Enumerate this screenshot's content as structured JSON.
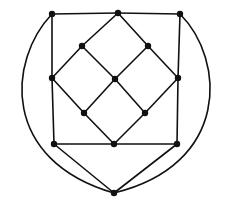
{
  "diagram": {
    "type": "planar-graph",
    "stroke_color": "#111111",
    "background": "#ffffff",
    "vertices": [
      {
        "id": "v1",
        "x": 52,
        "y": 14
      },
      {
        "id": "v2",
        "x": 118,
        "y": 13
      },
      {
        "id": "v3",
        "x": 180,
        "y": 14
      },
      {
        "id": "v4",
        "x": 82,
        "y": 46
      },
      {
        "id": "v5",
        "x": 148,
        "y": 46
      },
      {
        "id": "v6",
        "x": 52,
        "y": 78
      },
      {
        "id": "v7",
        "x": 115,
        "y": 79
      },
      {
        "id": "v8",
        "x": 178,
        "y": 78
      },
      {
        "id": "v9",
        "x": 84,
        "y": 113
      },
      {
        "id": "v10",
        "x": 145,
        "y": 113
      },
      {
        "id": "v11",
        "x": 54,
        "y": 144
      },
      {
        "id": "v12",
        "x": 114,
        "y": 144
      },
      {
        "id": "v13",
        "x": 177,
        "y": 144
      },
      {
        "id": "v14",
        "x": 114,
        "y": 193
      }
    ],
    "edges": [
      [
        "v1",
        "v2"
      ],
      [
        "v2",
        "v3"
      ],
      [
        "v1",
        "v6"
      ],
      [
        "v6",
        "v11"
      ],
      [
        "v3",
        "v8"
      ],
      [
        "v8",
        "v13"
      ],
      [
        "v11",
        "v12"
      ],
      [
        "v12",
        "v13"
      ],
      [
        "v2",
        "v4"
      ],
      [
        "v4",
        "v6"
      ],
      [
        "v2",
        "v5"
      ],
      [
        "v5",
        "v8"
      ],
      [
        "v4",
        "v7"
      ],
      [
        "v5",
        "v7"
      ],
      [
        "v6",
        "v9"
      ],
      [
        "v7",
        "v9"
      ],
      [
        "v7",
        "v10"
      ],
      [
        "v8",
        "v10"
      ],
      [
        "v9",
        "v12"
      ],
      [
        "v10",
        "v12"
      ],
      [
        "v11",
        "v14"
      ],
      [
        "v13",
        "v14"
      ]
    ],
    "curved_edges": [
      {
        "from": "v1",
        "to": "v14",
        "path": "M52,14 C8,60 0,160 114,193"
      },
      {
        "from": "v3",
        "to": "v14",
        "path": "M180,14 C226,60 230,165 114,193"
      }
    ]
  }
}
